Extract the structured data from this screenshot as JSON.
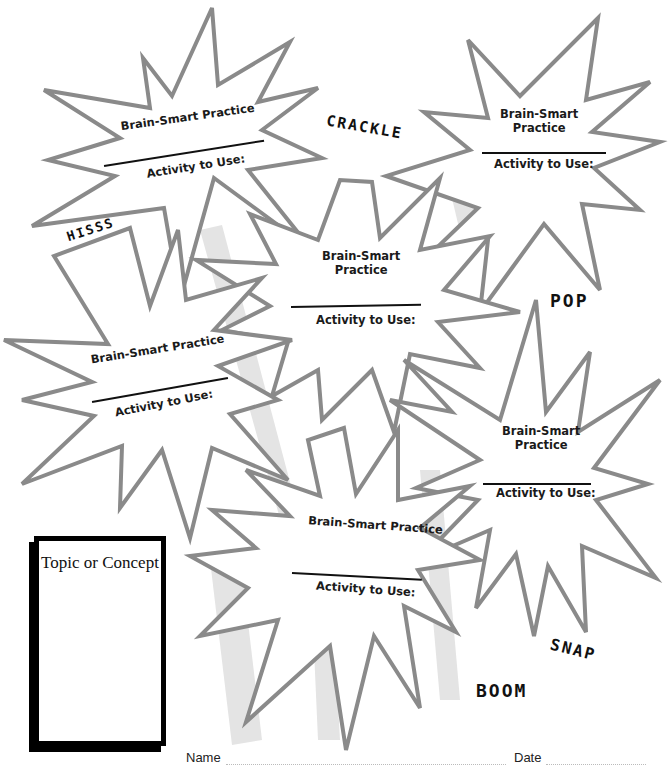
{
  "worksheet": {
    "bursts": [
      {
        "id": "burst-1",
        "practice_label": "Brain-Smart Practice",
        "activity_label": "Activity to Use:"
      },
      {
        "id": "burst-2",
        "practice_label_line1": "Brain-Smart",
        "practice_label_line2": "Practice",
        "activity_label": "Activity to Use:"
      },
      {
        "id": "burst-3",
        "practice_label_line1": "Brain-Smart",
        "practice_label_line2": "Practice",
        "activity_label": "Activity to Use:"
      },
      {
        "id": "burst-4",
        "practice_label": "Brain-Smart Practice",
        "activity_label": "Activity to Use:"
      },
      {
        "id": "burst-5",
        "practice_label_line1": "Brain-Smart",
        "practice_label_line2": "Practice",
        "activity_label": "Activity to Use:"
      },
      {
        "id": "burst-6",
        "practice_label": "Brain-Smart Practice",
        "activity_label": "Activity to Use:"
      }
    ],
    "sound_effects": {
      "crackle": "CRACKLE",
      "hisss": "HISSS",
      "pop": "POP",
      "snap": "SNAP",
      "boom": "BOOM"
    },
    "topic_box": {
      "title": "Topic or Concept"
    },
    "footer": {
      "name_label": "Name",
      "date_label": "Date"
    }
  }
}
